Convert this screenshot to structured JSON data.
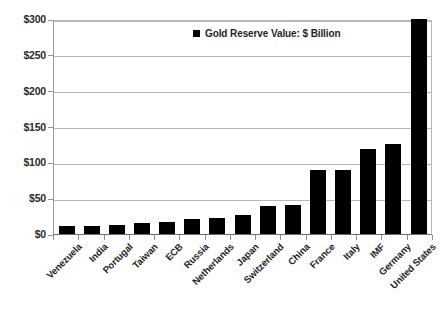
{
  "chart_data": {
    "type": "bar",
    "title": "",
    "xlabel": "",
    "ylabel": "",
    "ylim": [
      0,
      300
    ],
    "ytick_values": [
      0,
      50,
      100,
      150,
      200,
      250,
      300
    ],
    "ytick_labels": [
      "$0",
      "$50",
      "$100",
      "$150",
      "$200",
      "$250",
      "$300"
    ],
    "grid": true,
    "legend_position": "top-center",
    "legend": [
      "Gold Reserve Value:  $ Billion"
    ],
    "series_name": "Gold Reserve Value:  $ Billion",
    "bar_color": "#000000",
    "categories": [
      "Venezuela",
      "India",
      "Portugal",
      "Taiwan",
      "ECB",
      "Russia",
      "Netherlands",
      "Japan",
      "Switzerland",
      "China",
      "France",
      "Italy",
      "IMF",
      "Germany",
      "United States"
    ],
    "values": [
      11,
      11,
      13,
      15,
      17,
      21,
      22,
      26,
      39,
      40,
      89,
      89,
      119,
      126,
      300
    ]
  }
}
